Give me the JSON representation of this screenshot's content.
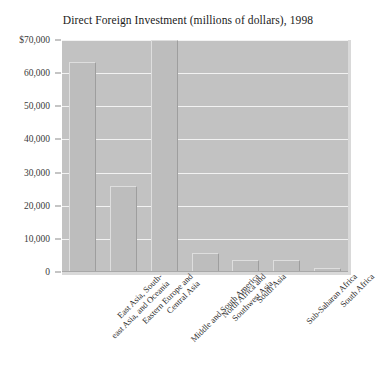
{
  "chart_data": {
    "type": "bar",
    "title": "Direct Foreign Investment (millions of dollars), 1998",
    "xlabel": "",
    "ylabel": "",
    "ylim": [
      0,
      70000
    ],
    "grid": true,
    "legend": "none",
    "currency_prefix": "$",
    "categories": [
      "East Asia, South-east Asia, and Oceania",
      "Eastern Europe and Central Asia",
      "Middle and South America",
      "North Africa and Southwest Asia",
      "South Asia",
      "Sub-Saharan Africa",
      "South Africa"
    ],
    "category_lines": [
      [
        "East Asia, South-",
        "east Asia, and Oceania"
      ],
      [
        "Eastern Europe and",
        "Central Asia"
      ],
      [
        "Middle and South America"
      ],
      [
        "North Africa and",
        "Southwest Asia"
      ],
      [
        "South Asia"
      ],
      [
        "Sub-Saharan Africa"
      ],
      [
        "South Africa"
      ]
    ],
    "values": [
      63500,
      26000,
      70000,
      5800,
      3500,
      3600,
      1200
    ],
    "ticks": [
      {
        "value": 70000,
        "label": "$70,000"
      },
      {
        "value": 60000,
        "label": "60,000"
      },
      {
        "value": 50000,
        "label": "50,000"
      },
      {
        "value": 40000,
        "label": "40,000"
      },
      {
        "value": 30000,
        "label": "30,000"
      },
      {
        "value": 20000,
        "label": "20,000"
      },
      {
        "value": 10000,
        "label": "10,000"
      },
      {
        "value": 0,
        "label": "0"
      }
    ],
    "colors": {
      "plot_background": "#c2c2c2",
      "bar_fill": "#bdbdbd",
      "gridline": "#f2f2f2",
      "text": "#2b2b2b",
      "page_background": "#ffffff"
    }
  }
}
